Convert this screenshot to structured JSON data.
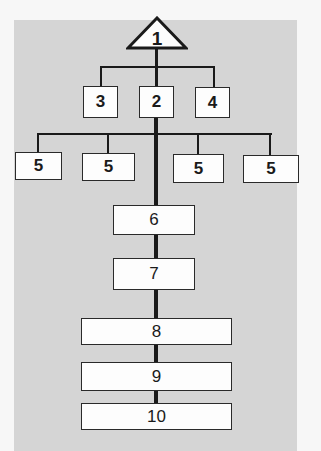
{
  "diagram": {
    "type": "hierarchy",
    "colors": {
      "page_background": "#f7f7f7",
      "panel_background": "#d5d5d5",
      "box_fill": "#fdfdfd",
      "line_color": "#1a1a1a"
    },
    "root": {
      "shape": "triangle",
      "label": "1"
    },
    "level2": [
      {
        "label": "3"
      },
      {
        "label": "2"
      },
      {
        "label": "4"
      }
    ],
    "level3": [
      {
        "label": "5"
      },
      {
        "label": "5"
      },
      {
        "label": "5"
      },
      {
        "label": "5"
      }
    ],
    "chain": [
      {
        "label": "6"
      },
      {
        "label": "7"
      },
      {
        "label": "8"
      },
      {
        "label": "9"
      },
      {
        "label": "10"
      }
    ]
  }
}
